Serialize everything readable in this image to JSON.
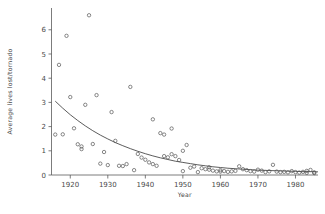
{
  "chart_data": {
    "type": "scatter",
    "title": "",
    "xlabel": "Year",
    "ylabel": "Average lives lost/tornado",
    "xlim": [
      1915,
      1986
    ],
    "ylim": [
      0,
      6.9
    ],
    "xticks": [
      1920,
      1930,
      1940,
      1950,
      1960,
      1970,
      1980
    ],
    "xtick_labels": [
      "1920",
      "1930",
      "1940",
      "1950",
      "1960",
      "1970",
      "1980"
    ],
    "yticks": [
      0,
      1,
      2,
      3,
      4,
      5,
      6
    ],
    "ytick_labels": [
      "0",
      "1",
      "2",
      "3",
      "4",
      "5",
      "6"
    ],
    "grid": false,
    "legend": "none",
    "marker": "open-circle",
    "points": [
      {
        "x": 1916,
        "y": 1.67
      },
      {
        "x": 1917,
        "y": 4.55
      },
      {
        "x": 1918,
        "y": 1.68
      },
      {
        "x": 1919,
        "y": 5.75
      },
      {
        "x": 1920,
        "y": 3.22
      },
      {
        "x": 1921,
        "y": 1.93
      },
      {
        "x": 1922,
        "y": 1.27
      },
      {
        "x": 1923,
        "y": 1.18
      },
      {
        "x": 1923,
        "y": 1.07
      },
      {
        "x": 1924,
        "y": 2.9
      },
      {
        "x": 1925,
        "y": 6.6
      },
      {
        "x": 1926,
        "y": 1.28
      },
      {
        "x": 1927,
        "y": 3.3
      },
      {
        "x": 1928,
        "y": 0.47
      },
      {
        "x": 1929,
        "y": 0.95
      },
      {
        "x": 1930,
        "y": 0.41
      },
      {
        "x": 1931,
        "y": 2.6
      },
      {
        "x": 1932,
        "y": 1.41
      },
      {
        "x": 1933,
        "y": 0.38
      },
      {
        "x": 1934,
        "y": 0.37
      },
      {
        "x": 1935,
        "y": 0.45
      },
      {
        "x": 1936,
        "y": 3.64
      },
      {
        "x": 1937,
        "y": 0.2
      },
      {
        "x": 1938,
        "y": 0.87
      },
      {
        "x": 1939,
        "y": 0.72
      },
      {
        "x": 1940,
        "y": 0.63
      },
      {
        "x": 1941,
        "y": 0.52
      },
      {
        "x": 1942,
        "y": 2.3
      },
      {
        "x": 1942,
        "y": 0.45
      },
      {
        "x": 1943,
        "y": 0.38
      },
      {
        "x": 1944,
        "y": 1.73
      },
      {
        "x": 1945,
        "y": 1.67
      },
      {
        "x": 1945,
        "y": 0.78
      },
      {
        "x": 1946,
        "y": 0.73
      },
      {
        "x": 1947,
        "y": 1.92
      },
      {
        "x": 1947,
        "y": 0.86
      },
      {
        "x": 1948,
        "y": 0.78
      },
      {
        "x": 1949,
        "y": 0.62
      },
      {
        "x": 1950,
        "y": 1.0
      },
      {
        "x": 1950,
        "y": 0.16
      },
      {
        "x": 1951,
        "y": 1.24
      },
      {
        "x": 1952,
        "y": 0.3
      },
      {
        "x": 1953,
        "y": 0.35
      },
      {
        "x": 1954,
        "y": 0.12
      },
      {
        "x": 1955,
        "y": 0.28
      },
      {
        "x": 1956,
        "y": 0.24
      },
      {
        "x": 1957,
        "y": 0.32
      },
      {
        "x": 1957,
        "y": 0.22
      },
      {
        "x": 1958,
        "y": 0.18
      },
      {
        "x": 1959,
        "y": 0.15
      },
      {
        "x": 1960,
        "y": 0.14
      },
      {
        "x": 1960,
        "y": 0.2
      },
      {
        "x": 1961,
        "y": 0.16
      },
      {
        "x": 1962,
        "y": 0.13
      },
      {
        "x": 1963,
        "y": 0.15
      },
      {
        "x": 1964,
        "y": 0.17
      },
      {
        "x": 1965,
        "y": 0.36
      },
      {
        "x": 1966,
        "y": 0.24
      },
      {
        "x": 1967,
        "y": 0.2
      },
      {
        "x": 1968,
        "y": 0.16
      },
      {
        "x": 1969,
        "y": 0.14
      },
      {
        "x": 1970,
        "y": 0.22
      },
      {
        "x": 1971,
        "y": 0.18
      },
      {
        "x": 1972,
        "y": 0.12
      },
      {
        "x": 1973,
        "y": 0.15
      },
      {
        "x": 1974,
        "y": 0.42
      },
      {
        "x": 1975,
        "y": 0.14
      },
      {
        "x": 1976,
        "y": 0.12
      },
      {
        "x": 1977,
        "y": 0.13
      },
      {
        "x": 1978,
        "y": 0.11
      },
      {
        "x": 1979,
        "y": 0.16
      },
      {
        "x": 1980,
        "y": 0.12
      },
      {
        "x": 1981,
        "y": 0.1
      },
      {
        "x": 1982,
        "y": 0.13
      },
      {
        "x": 1983,
        "y": 0.17
      },
      {
        "x": 1983,
        "y": 0.09
      },
      {
        "x": 1984,
        "y": 0.21
      },
      {
        "x": 1985,
        "y": 0.11
      },
      {
        "x": 1985,
        "y": 0.08
      }
    ],
    "fit_curve": {
      "name": "exponential decay fit",
      "points": [
        {
          "x": 1916,
          "y": 3.05
        },
        {
          "x": 1918,
          "y": 2.76
        },
        {
          "x": 1920,
          "y": 2.49
        },
        {
          "x": 1922,
          "y": 2.25
        },
        {
          "x": 1924,
          "y": 2.03
        },
        {
          "x": 1926,
          "y": 1.83
        },
        {
          "x": 1928,
          "y": 1.65
        },
        {
          "x": 1930,
          "y": 1.49
        },
        {
          "x": 1932,
          "y": 1.34
        },
        {
          "x": 1934,
          "y": 1.21
        },
        {
          "x": 1936,
          "y": 1.09
        },
        {
          "x": 1938,
          "y": 0.98
        },
        {
          "x": 1940,
          "y": 0.88
        },
        {
          "x": 1942,
          "y": 0.79
        },
        {
          "x": 1944,
          "y": 0.71
        },
        {
          "x": 1946,
          "y": 0.64
        },
        {
          "x": 1948,
          "y": 0.57
        },
        {
          "x": 1950,
          "y": 0.52
        },
        {
          "x": 1952,
          "y": 0.47
        },
        {
          "x": 1954,
          "y": 0.42
        },
        {
          "x": 1956,
          "y": 0.38
        },
        {
          "x": 1958,
          "y": 0.34
        },
        {
          "x": 1960,
          "y": 0.31
        },
        {
          "x": 1962,
          "y": 0.28
        },
        {
          "x": 1964,
          "y": 0.26
        },
        {
          "x": 1966,
          "y": 0.24
        },
        {
          "x": 1968,
          "y": 0.22
        },
        {
          "x": 1970,
          "y": 0.2
        },
        {
          "x": 1972,
          "y": 0.19
        },
        {
          "x": 1974,
          "y": 0.18
        },
        {
          "x": 1976,
          "y": 0.17
        },
        {
          "x": 1978,
          "y": 0.16
        },
        {
          "x": 1980,
          "y": 0.15
        },
        {
          "x": 1982,
          "y": 0.14
        },
        {
          "x": 1984,
          "y": 0.14
        },
        {
          "x": 1986,
          "y": 0.13
        }
      ]
    }
  }
}
